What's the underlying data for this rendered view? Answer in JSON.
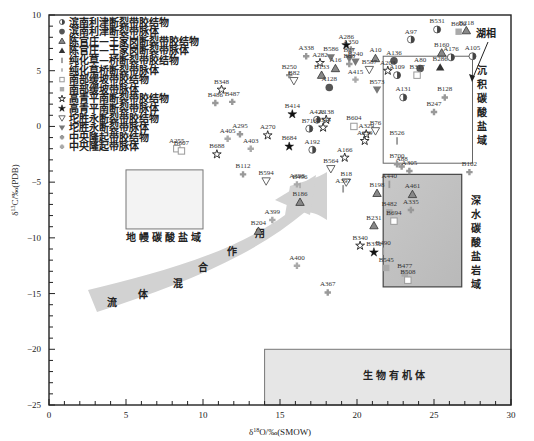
{
  "chart_data": {
    "type": "scatter",
    "title": "",
    "xlabel": "δ18O/‰(SMOW)",
    "ylabel": "δ13C/‰(PDB)",
    "xlim": [
      0,
      30
    ],
    "ylim": [
      -25,
      10
    ],
    "xticks": [
      0,
      5,
      10,
      15,
      20,
      25,
      30
    ],
    "yticks": [
      10,
      5,
      0,
      -5,
      -10,
      -15,
      -20,
      -25
    ],
    "grid": false,
    "legend_position": "upper-left",
    "legend": [
      {
        "id": "bn_g",
        "label": "滨南利津断裂带胶结物",
        "marker": "circle-half",
        "color": "#888888"
      },
      {
        "id": "bn_v",
        "label": "滨南利津断裂带脉体",
        "marker": "circle",
        "color": "#555555"
      },
      {
        "id": "cg_g",
        "label": "陈官庄—王家岗断裂带胶结物",
        "marker": "triangle-open",
        "color": "#666666"
      },
      {
        "id": "cg_v",
        "label": "陈官庄—王家岗断裂带脉体",
        "marker": "triangle",
        "color": "#333333"
      },
      {
        "id": "ch_g",
        "label": "纯化草—桥断裂带胶结物",
        "marker": "bar",
        "color": "#999999"
      },
      {
        "id": "ch_v",
        "label": "纯化草桥断裂带脉体",
        "marker": "bar-small",
        "color": "#aaaaaa"
      },
      {
        "id": "nb_g",
        "label": "南部缓坡带胶结物",
        "marker": "square-open",
        "color": "#999999"
      },
      {
        "id": "nb_v",
        "label": "南部缓坡带脉体",
        "marker": "square",
        "color": "#aaaaaa"
      },
      {
        "id": "gq_g",
        "label": "高青平南断裂带胶结物",
        "marker": "star-open",
        "color": "#333333"
      },
      {
        "id": "gq_v",
        "label": "高青平南断裂带脉体",
        "marker": "star",
        "color": "#111111"
      },
      {
        "id": "ts_g",
        "label": "坨胜永断裂带胶结物",
        "marker": "tri-down-open",
        "color": "#666666"
      },
      {
        "id": "ts_v",
        "label": "坨胜永断裂带脉体",
        "marker": "tri-down",
        "color": "#777777"
      },
      {
        "id": "zy_g",
        "label": "中央隆起带胶结物",
        "marker": "plus-dot",
        "color": "#999999"
      },
      {
        "id": "zy_v",
        "label": "中央隆起带脉体",
        "marker": "plus",
        "color": "#aaaaaa"
      }
    ],
    "regions": [
      {
        "label": "地幔碳酸盐域",
        "x": [
          -8,
          -4
        ],
        "xrange": [
          5,
          10
        ],
        "yrange": [
          -9,
          -4
        ]
      },
      {
        "label": "沉积碳酸盐域",
        "xrange": [
          21.7,
          27.5
        ],
        "yrange": [
          -4,
          3.9
        ]
      },
      {
        "label": "深水碳酸盐岩域",
        "xrange": [
          21.7,
          26.8
        ],
        "yrange": [
          -15,
          -5
        ]
      },
      {
        "label": "生物有机体",
        "xrange": [
          14,
          30
        ],
        "yrange": [
          -25,
          -20
        ]
      }
    ],
    "annotations": [
      {
        "text": "湖相",
        "x": 28.2,
        "y": 8.1
      },
      {
        "text": "流体混合作用",
        "type": "arrow",
        "path": "from (2,-14) to (20,-5)"
      }
    ],
    "points": [
      {
        "name": "B531",
        "x": 25.2,
        "y": 8.7,
        "series": "bn_g"
      },
      {
        "name": "B218",
        "x": 27.1,
        "y": 8.6,
        "series": "cg_g"
      },
      {
        "name": "B600",
        "x": 26.6,
        "y": 8.5,
        "series": "nb_v"
      },
      {
        "name": "A97",
        "x": 23.5,
        "y": 7.8,
        "series": "bn_g"
      },
      {
        "name": "A286",
        "x": 19.3,
        "y": 7.3,
        "series": "gq_v"
      },
      {
        "name": "A350",
        "x": 19.6,
        "y": 6.9,
        "series": "zy_g"
      },
      {
        "name": "A338",
        "x": 16.7,
        "y": 6.3,
        "series": "zy_g"
      },
      {
        "name": "B586",
        "x": 18.3,
        "y": 6.2,
        "series": "ts_v"
      },
      {
        "name": "B27",
        "x": 19.5,
        "y": 6.1,
        "series": "ts_v"
      },
      {
        "name": "A282",
        "x": 17.6,
        "y": 5.7,
        "series": "gq_g"
      },
      {
        "name": "B83",
        "x": 19.5,
        "y": 5.6,
        "series": "zy_g"
      },
      {
        "name": "B240",
        "x": 19.9,
        "y": 5.8,
        "series": "ts_v"
      },
      {
        "name": "A16",
        "x": 18.6,
        "y": 5.2,
        "series": "cg_g"
      },
      {
        "name": "A10",
        "x": 21.2,
        "y": 6.1,
        "series": "cg_g"
      },
      {
        "name": "A136",
        "x": 22.4,
        "y": 5.9,
        "series": "bn_v"
      },
      {
        "name": "A203",
        "x": 22.0,
        "y": 5.0,
        "series": "gq_g"
      },
      {
        "name": "A109",
        "x": 22.6,
        "y": 4.6,
        "series": "bn_g"
      },
      {
        "name": "A80",
        "x": 24.1,
        "y": 5.2,
        "series": "bn_v"
      },
      {
        "name": "B317",
        "x": 23.9,
        "y": 4.6,
        "series": "nb_g"
      },
      {
        "name": "B286",
        "x": 25.4,
        "y": 5.3,
        "series": "cg_v"
      },
      {
        "name": "B160",
        "x": 25.5,
        "y": 6.6,
        "series": "cg_g"
      },
      {
        "name": "A176",
        "x": 26.1,
        "y": 6.2,
        "series": "bn_g"
      },
      {
        "name": "A105",
        "x": 27.5,
        "y": 6.3,
        "series": "bn_g"
      },
      {
        "name": "B587",
        "x": 20.8,
        "y": 5.1,
        "series": "ts_g"
      },
      {
        "name": "B133",
        "x": 17.7,
        "y": 4.6,
        "series": "cg_g"
      },
      {
        "name": "B250",
        "x": 15.6,
        "y": 4.6,
        "series": "zy_g"
      },
      {
        "name": "B82",
        "x": 15.9,
        "y": 4.1,
        "series": "ts_g"
      },
      {
        "name": "A128",
        "x": 18.2,
        "y": 3.5,
        "series": "bn_v"
      },
      {
        "name": "A415",
        "x": 19.9,
        "y": 4.2,
        "series": "zy_v"
      },
      {
        "name": "B573",
        "x": 21.3,
        "y": 3.3,
        "series": "ts_v"
      },
      {
        "name": "A131",
        "x": 23.0,
        "y": 2.6,
        "series": "bn_g"
      },
      {
        "name": "B128",
        "x": 25.7,
        "y": 2.6,
        "series": "zy_g"
      },
      {
        "name": "B247",
        "x": 25.0,
        "y": 1.3,
        "series": "zy_g"
      },
      {
        "name": "B526",
        "x": 22.6,
        "y": -1.3,
        "series": "ch_g"
      },
      {
        "name": "B348",
        "x": 11.2,
        "y": 3.3,
        "series": "gq_g"
      },
      {
        "name": "B486",
        "x": 10.8,
        "y": 2.1,
        "series": "zy_g"
      },
      {
        "name": "B487",
        "x": 11.9,
        "y": 2.2,
        "series": "zy_g"
      },
      {
        "name": "B414",
        "x": 15.8,
        "y": 1.1,
        "series": "gq_v"
      },
      {
        "name": "A423",
        "x": 17.4,
        "y": 0.6,
        "series": "bn_g"
      },
      {
        "name": "A138",
        "x": 18.0,
        "y": 0.6,
        "series": "gq_g"
      },
      {
        "name": "B716",
        "x": 16.9,
        "y": -0.2,
        "series": "bn_g"
      },
      {
        "name": "B344",
        "x": 17.8,
        "y": -0.1,
        "series": "gq_g"
      },
      {
        "name": "B604",
        "x": 19.8,
        "y": 0.0,
        "series": "nb_g"
      },
      {
        "name": "B76",
        "x": 21.2,
        "y": -0.4,
        "series": "ts_g"
      },
      {
        "name": "A329",
        "x": 20.6,
        "y": -0.7,
        "series": "gq_g"
      },
      {
        "name": "A239",
        "x": 20.5,
        "y": -1.3,
        "series": "gq_g"
      },
      {
        "name": "A270",
        "x": 14.2,
        "y": -0.8,
        "series": "gq_g"
      },
      {
        "name": "A295",
        "x": 12.4,
        "y": -0.7,
        "series": "zy_g"
      },
      {
        "name": "A405",
        "x": 11.6,
        "y": -1.1,
        "series": "zy_v"
      },
      {
        "name": "A403",
        "x": 13.1,
        "y": -2.0,
        "series": "zy_v"
      },
      {
        "name": "B684",
        "x": 15.6,
        "y": -1.8,
        "series": "gq_v"
      },
      {
        "name": "A192",
        "x": 17.1,
        "y": -2.1,
        "series": "bn_g"
      },
      {
        "name": "A166",
        "x": 19.2,
        "y": -2.8,
        "series": "gq_g"
      },
      {
        "name": "B700",
        "x": 22.6,
        "y": -3.4,
        "series": "zy_g"
      },
      {
        "name": "A255",
        "x": 8.3,
        "y": -2.0,
        "series": "nb_g"
      },
      {
        "name": "B607",
        "x": 8.6,
        "y": -2.2,
        "series": "nb_g"
      },
      {
        "name": "B688",
        "x": 10.9,
        "y": -2.5,
        "series": "gq_g"
      },
      {
        "name": "B112",
        "x": 12.6,
        "y": -4.3,
        "series": "zy_g"
      },
      {
        "name": "B594",
        "x": 14.1,
        "y": -4.9,
        "series": "ts_g"
      },
      {
        "name": "A398",
        "x": 16.1,
        "y": -5.2,
        "series": "zy_v"
      },
      {
        "name": "B496",
        "x": 16.3,
        "y": -5.3,
        "series": "ch_v"
      },
      {
        "name": "B564",
        "x": 18.3,
        "y": -3.8,
        "series": "ts_g"
      },
      {
        "name": "B18",
        "x": 19.3,
        "y": -5.0,
        "series": "ts_g"
      },
      {
        "name": "A397",
        "x": 19.1,
        "y": -5.6,
        "series": "ch_g"
      },
      {
        "name": "B198",
        "x": 21.3,
        "y": -6.0,
        "series": "cg_g"
      },
      {
        "name": "B186",
        "x": 16.3,
        "y": -6.8,
        "series": "cg_g"
      },
      {
        "name": "A399",
        "x": 14.5,
        "y": -8.4,
        "series": "zy_v"
      },
      {
        "name": "B204",
        "x": 13.6,
        "y": -9.4,
        "series": "cg_g"
      },
      {
        "name": "B231",
        "x": 21.1,
        "y": -8.9,
        "series": "cg_g"
      },
      {
        "name": "B340",
        "x": 20.2,
        "y": -10.7,
        "series": "gq_g"
      },
      {
        "name": "B350",
        "x": 21.1,
        "y": -11.3,
        "series": "gq_v"
      },
      {
        "name": "B490",
        "x": 21.7,
        "y": -11.2,
        "series": "ch_g"
      },
      {
        "name": "A400",
        "x": 16.1,
        "y": -12.5,
        "series": "zy_v"
      },
      {
        "name": "A367",
        "x": 18.1,
        "y": -14.9,
        "series": "zy_g"
      },
      {
        "name": "A88",
        "x": 22.9,
        "y": -3.6,
        "series": "zy_g"
      },
      {
        "name": "A305",
        "x": 23.4,
        "y": -4.0,
        "series": "zy_g"
      },
      {
        "name": "A440",
        "x": 22.1,
        "y": -5.2,
        "series": "ch_g"
      },
      {
        "name": "A461",
        "x": 23.6,
        "y": -6.1,
        "series": "cg_g"
      },
      {
        "name": "A335",
        "x": 23.5,
        "y": -7.5,
        "series": "zy_g"
      },
      {
        "name": "B482",
        "x": 22.1,
        "y": -7.7,
        "series": "nb_v"
      },
      {
        "name": "B694",
        "x": 22.4,
        "y": -8.5,
        "series": "nb_g"
      },
      {
        "name": "B545",
        "x": 21.9,
        "y": -12.7,
        "series": "nb_v"
      },
      {
        "name": "B477",
        "x": 23.1,
        "y": -13.2,
        "series": "nb_v"
      },
      {
        "name": "B508",
        "x": 23.3,
        "y": -13.8,
        "series": "nb_g"
      },
      {
        "name": "B102",
        "x": 27.3,
        "y": -4.1,
        "series": "zy_g"
      }
    ]
  },
  "labels": {
    "xlabel_prefix": "δ",
    "xlabel_sup": "18",
    "xlabel_rest": "O/‰(SMOW)",
    "ylabel_prefix": "δ",
    "ylabel_sup": "13",
    "ylabel_rest": "C/‰(PDB)",
    "mantle_region": "地幔碳酸盐域",
    "sedimentary_region": "沉积碳酸盐域",
    "deepwater_region": "深水碳酸盐岩域",
    "organic_region": "生物有机体",
    "lacustrine": "湖相",
    "fluid_mixing": [
      "流",
      "体",
      "混",
      "合",
      "作",
      "用"
    ]
  }
}
